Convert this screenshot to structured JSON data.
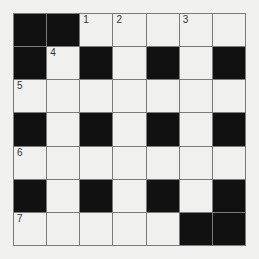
{
  "puzzle": {
    "size": 7,
    "grid": [
      [
        "#",
        "#",
        "1",
        "2",
        "",
        "3",
        ""
      ],
      [
        "#",
        "4",
        "#",
        "",
        "#",
        "",
        "#"
      ],
      [
        "5",
        "",
        "",
        "",
        "",
        "",
        ""
      ],
      [
        "#",
        "",
        "#",
        "",
        "#",
        "",
        "#"
      ],
      [
        "6",
        "",
        "",
        "",
        "",
        "",
        ""
      ],
      [
        "#",
        "",
        "#",
        "",
        "#",
        "",
        "#"
      ],
      [
        "7",
        "",
        "",
        "",
        "",
        "#",
        "#"
      ]
    ],
    "colors": {
      "black": "#111111",
      "white": "#f0f0ee",
      "line": "#7a7a7a"
    }
  }
}
